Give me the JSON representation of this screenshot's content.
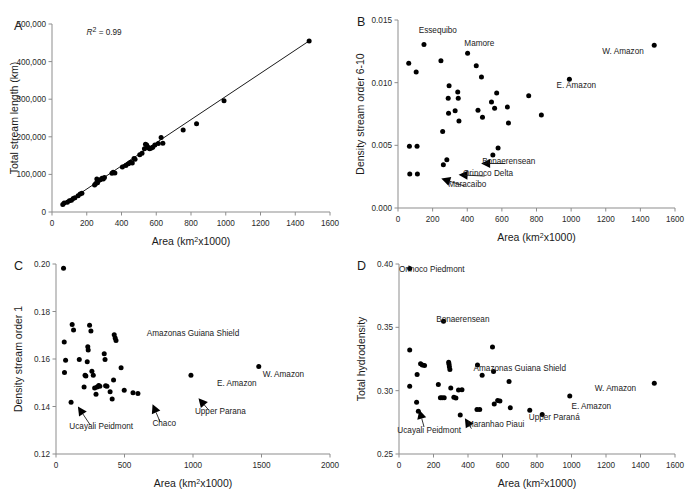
{
  "figure": {
    "panels": [
      "A",
      "B",
      "C",
      "D"
    ]
  },
  "chart_data": [
    {
      "panel": "A",
      "type": "scatter",
      "title": "",
      "xlabel": "Area (km2x1000)",
      "ylabel": "Total stream length (km)",
      "xlim": [
        0,
        1600
      ],
      "ylim": [
        0,
        500000
      ],
      "xticks": [
        0,
        200,
        400,
        600,
        800,
        1000,
        1200,
        1400,
        1600
      ],
      "xticklabels": [
        "0",
        "200",
        "400",
        "600",
        "800",
        "1000",
        "1200",
        "1400",
        "1600"
      ],
      "yticks": [
        0,
        100000,
        200000,
        300000,
        400000,
        500000
      ],
      "yticklabels": [
        "0",
        "100,000",
        "200,000",
        "300,000",
        "400,000",
        "500,000"
      ],
      "grid": false,
      "legend": "none",
      "annotations": [
        {
          "text": "R2 = 0.99",
          "x": 300,
          "y": 470000
        }
      ],
      "trendline": {
        "x": [
          60,
          1480
        ],
        "y": [
          18000,
          455000
        ]
      },
      "points": [
        {
          "x": 62,
          "y": 20000
        },
        {
          "x": 70,
          "y": 24000
        },
        {
          "x": 88,
          "y": 26000
        },
        {
          "x": 100,
          "y": 30000
        },
        {
          "x": 112,
          "y": 31000
        },
        {
          "x": 122,
          "y": 36000
        },
        {
          "x": 132,
          "y": 38000
        },
        {
          "x": 150,
          "y": 43000
        },
        {
          "x": 162,
          "y": 48000
        },
        {
          "x": 172,
          "y": 50000
        },
        {
          "x": 245,
          "y": 72000
        },
        {
          "x": 252,
          "y": 76000
        },
        {
          "x": 258,
          "y": 88000
        },
        {
          "x": 262,
          "y": 78000
        },
        {
          "x": 268,
          "y": 84000
        },
        {
          "x": 278,
          "y": 86000
        },
        {
          "x": 288,
          "y": 90000
        },
        {
          "x": 295,
          "y": 88000
        },
        {
          "x": 302,
          "y": 92000
        },
        {
          "x": 345,
          "y": 103000
        },
        {
          "x": 352,
          "y": 106000
        },
        {
          "x": 362,
          "y": 104000
        },
        {
          "x": 405,
          "y": 120000
        },
        {
          "x": 425,
          "y": 124000
        },
        {
          "x": 440,
          "y": 128000
        },
        {
          "x": 452,
          "y": 132000
        },
        {
          "x": 462,
          "y": 130000
        },
        {
          "x": 472,
          "y": 142000
        },
        {
          "x": 478,
          "y": 140000
        },
        {
          "x": 505,
          "y": 152000
        },
        {
          "x": 518,
          "y": 156000
        },
        {
          "x": 532,
          "y": 168000
        },
        {
          "x": 538,
          "y": 180000
        },
        {
          "x": 545,
          "y": 178000
        },
        {
          "x": 552,
          "y": 172000
        },
        {
          "x": 558,
          "y": 170000
        },
        {
          "x": 562,
          "y": 168000
        },
        {
          "x": 572,
          "y": 170000
        },
        {
          "x": 580,
          "y": 172000
        },
        {
          "x": 592,
          "y": 178000
        },
        {
          "x": 612,
          "y": 182000
        },
        {
          "x": 628,
          "y": 198000
        },
        {
          "x": 638,
          "y": 183000
        },
        {
          "x": 755,
          "y": 218000
        },
        {
          "x": 832,
          "y": 235000
        },
        {
          "x": 990,
          "y": 296000
        },
        {
          "x": 1480,
          "y": 455000
        }
      ]
    },
    {
      "panel": "B",
      "type": "scatter",
      "title": "",
      "xlabel": "Area (km2x1000)",
      "ylabel": "Density stream order 6-10",
      "xlim": [
        0,
        1600
      ],
      "ylim": [
        0.0,
        0.015
      ],
      "xticks": [
        0,
        200,
        400,
        600,
        800,
        1000,
        1200,
        1400,
        1600
      ],
      "xticklabels": [
        "0",
        "200",
        "400",
        "600",
        "800",
        "1000",
        "1200",
        "1400",
        "1600"
      ],
      "yticks": [
        0.0,
        0.005,
        0.01,
        0.015
      ],
      "yticklabels": [
        "0.000",
        "0.005",
        "0.010",
        "0.015"
      ],
      "grid": false,
      "legend": "none",
      "labels": [
        {
          "text": "Essequibo",
          "x": 230,
          "y": 0.014
        },
        {
          "text": "Mamore",
          "x": 470,
          "y": 0.01295
        },
        {
          "text": "W. Amazon",
          "x": 1300,
          "y": 0.01225
        },
        {
          "text": "E. Amazon",
          "x": 1030,
          "y": 0.00955
        },
        {
          "text": "Bonaerensean",
          "x": 640,
          "y": 0.00355
        },
        {
          "text": "Orinoco Delta",
          "x": 520,
          "y": 0.00255
        },
        {
          "text": "Maracaibo",
          "x": 400,
          "y": 0.00165
        }
      ],
      "arrows": [
        {
          "label": "Bonaerensean",
          "from_x": 620,
          "from_y": 0.00355,
          "to_x": 480,
          "to_y": 0.00355
        },
        {
          "label": "Orinoco Delta",
          "from_x": 500,
          "from_y": 0.00255,
          "to_x": 350,
          "to_y": 0.00265
        },
        {
          "label": "Maracaibo",
          "from_x": 385,
          "from_y": 0.00175,
          "to_x": 250,
          "to_y": 0.00235
        }
      ],
      "points": [
        {
          "x": 62,
          "y": 0.01155
        },
        {
          "x": 105,
          "y": 0.01085
        },
        {
          "x": 150,
          "y": 0.01305
        },
        {
          "x": 248,
          "y": 0.01175
        },
        {
          "x": 258,
          "y": 0.0061
        },
        {
          "x": 295,
          "y": 0.00975
        },
        {
          "x": 290,
          "y": 0.00875
        },
        {
          "x": 292,
          "y": 0.00755
        },
        {
          "x": 330,
          "y": 0.00775
        },
        {
          "x": 345,
          "y": 0.00925
        },
        {
          "x": 348,
          "y": 0.00875
        },
        {
          "x": 352,
          "y": 0.00695
        },
        {
          "x": 402,
          "y": 0.01235
        },
        {
          "x": 452,
          "y": 0.01135
        },
        {
          "x": 462,
          "y": 0.0078
        },
        {
          "x": 482,
          "y": 0.01045
        },
        {
          "x": 488,
          "y": 0.00725
        },
        {
          "x": 540,
          "y": 0.00845
        },
        {
          "x": 548,
          "y": 0.00422
        },
        {
          "x": 558,
          "y": 0.00795
        },
        {
          "x": 570,
          "y": 0.00918
        },
        {
          "x": 578,
          "y": 0.00478
        },
        {
          "x": 632,
          "y": 0.00805
        },
        {
          "x": 638,
          "y": 0.00678
        },
        {
          "x": 755,
          "y": 0.00895
        },
        {
          "x": 828,
          "y": 0.00742
        },
        {
          "x": 990,
          "y": 0.01028
        },
        {
          "x": 1480,
          "y": 0.01298
        },
        {
          "x": 66,
          "y": 0.00492
        },
        {
          "x": 110,
          "y": 0.00492
        },
        {
          "x": 68,
          "y": 0.00272
        },
        {
          "x": 112,
          "y": 0.00272
        },
        {
          "x": 262,
          "y": 0.00345
        },
        {
          "x": 282,
          "y": 0.00385
        }
      ]
    },
    {
      "panel": "C",
      "type": "scatter",
      "title": "",
      "xlabel": "Area (km2x1000)",
      "ylabel": "Density stream order 1",
      "xlim": [
        0,
        2000
      ],
      "ylim": [
        0.12,
        0.2
      ],
      "xticks": [
        0,
        500,
        1000,
        1500,
        2000
      ],
      "xticklabels": [
        "0",
        "500",
        "1000",
        "1500",
        "2000"
      ],
      "yticks": [
        0.12,
        0.14,
        0.16,
        0.18,
        0.2
      ],
      "yticklabels": [
        "0.12",
        "0.14",
        "0.16",
        "0.18",
        "0.20"
      ],
      "grid": false,
      "legend": "none",
      "labels": [
        {
          "text": "Amazonas Guiana Shield",
          "x": 1000,
          "y": 0.1695
        },
        {
          "text": "W. Amazon",
          "x": 1660,
          "y": 0.1525
        },
        {
          "text": "E. Amazon",
          "x": 1320,
          "y": 0.1487
        },
        {
          "text": "Ucayali Peidmont",
          "x": 330,
          "y": 0.1305
        },
        {
          "text": "Chaco",
          "x": 790,
          "y": 0.1318
        },
        {
          "text": "Upper Parana",
          "x": 1200,
          "y": 0.1368
        }
      ],
      "arrows": [
        {
          "label": "Ucayali Peidmont",
          "from_x": 250,
          "from_y": 0.1322,
          "to_x": 160,
          "to_y": 0.14
        },
        {
          "label": "Chaco",
          "from_x": 760,
          "from_y": 0.1335,
          "to_x": 705,
          "to_y": 0.141
        },
        {
          "label": "Upper Parana",
          "from_x": 1115,
          "from_y": 0.1385,
          "to_x": 1040,
          "to_y": 0.1435
        }
      ],
      "points": [
        {
          "x": 55,
          "y": 0.1982
        },
        {
          "x": 60,
          "y": 0.1672
        },
        {
          "x": 70,
          "y": 0.1595
        },
        {
          "x": 62,
          "y": 0.1543
        },
        {
          "x": 118,
          "y": 0.1745
        },
        {
          "x": 128,
          "y": 0.1722
        },
        {
          "x": 110,
          "y": 0.1418
        },
        {
          "x": 170,
          "y": 0.1598
        },
        {
          "x": 228,
          "y": 0.1588
        },
        {
          "x": 245,
          "y": 0.1742
        },
        {
          "x": 255,
          "y": 0.1718
        },
        {
          "x": 232,
          "y": 0.1652
        },
        {
          "x": 235,
          "y": 0.1638
        },
        {
          "x": 212,
          "y": 0.1532
        },
        {
          "x": 218,
          "y": 0.1528
        },
        {
          "x": 205,
          "y": 0.1482
        },
        {
          "x": 262,
          "y": 0.1548
        },
        {
          "x": 272,
          "y": 0.1532
        },
        {
          "x": 282,
          "y": 0.1478
        },
        {
          "x": 292,
          "y": 0.1452
        },
        {
          "x": 300,
          "y": 0.1482
        },
        {
          "x": 312,
          "y": 0.1488
        },
        {
          "x": 320,
          "y": 0.1485
        },
        {
          "x": 352,
          "y": 0.1622
        },
        {
          "x": 358,
          "y": 0.1598
        },
        {
          "x": 362,
          "y": 0.1487
        },
        {
          "x": 372,
          "y": 0.1485
        },
        {
          "x": 395,
          "y": 0.1462
        },
        {
          "x": 420,
          "y": 0.1512
        },
        {
          "x": 425,
          "y": 0.1702
        },
        {
          "x": 432,
          "y": 0.1688
        },
        {
          "x": 438,
          "y": 0.1678
        },
        {
          "x": 410,
          "y": 0.1432
        },
        {
          "x": 475,
          "y": 0.1563
        },
        {
          "x": 498,
          "y": 0.1468
        },
        {
          "x": 562,
          "y": 0.1458
        },
        {
          "x": 598,
          "y": 0.1455
        },
        {
          "x": 985,
          "y": 0.1532
        },
        {
          "x": 1480,
          "y": 0.1568
        }
      ]
    },
    {
      "panel": "D",
      "type": "scatter",
      "title": "",
      "xlabel": "Area (km2x1000)",
      "ylabel": "Total hydrodensity",
      "xlim": [
        0,
        1600
      ],
      "ylim": [
        0.25,
        0.4
      ],
      "xticks": [
        0,
        200,
        400,
        600,
        800,
        1000,
        1200,
        1400,
        1600
      ],
      "xticklabels": [
        "0",
        "200",
        "400",
        "600",
        "800",
        "1000",
        "1200",
        "1400",
        "1600"
      ],
      "yticks": [
        0.25,
        0.3,
        0.35,
        0.4
      ],
      "yticklabels": [
        "0.25",
        "0.30",
        "0.35",
        "0.40"
      ],
      "grid": false,
      "legend": "none",
      "labels": [
        {
          "text": "Orinoco Piedmont",
          "x": 190,
          "y": 0.3935
        },
        {
          "text": "Bonaerensean",
          "x": 370,
          "y": 0.3545
        },
        {
          "text": "Amazonas Guiana Shield",
          "x": 700,
          "y": 0.3152
        },
        {
          "text": "W. Amazon",
          "x": 1255,
          "y": 0.2995
        },
        {
          "text": "E. Amazon",
          "x": 1115,
          "y": 0.2855
        },
        {
          "text": "Ucayali Peidmont",
          "x": 175,
          "y": 0.2665
        },
        {
          "text": "Maranhao Piaui",
          "x": 560,
          "y": 0.2715
        },
        {
          "text": "Upper Paraná",
          "x": 900,
          "y": 0.2768
        }
      ],
      "arrows": [
        {
          "label": "Ucayali Peidmont",
          "from_x": 145,
          "from_y": 0.2715,
          "to_x": 118,
          "to_y": 0.2848
        },
        {
          "label": "Maranhao Piaui",
          "from_x": 420,
          "from_y": 0.27,
          "to_x": 382,
          "to_y": 0.2782
        }
      ],
      "points": [
        {
          "x": 62,
          "y": 0.3965
        },
        {
          "x": 258,
          "y": 0.3548
        },
        {
          "x": 62,
          "y": 0.3322
        },
        {
          "x": 62,
          "y": 0.3035
        },
        {
          "x": 105,
          "y": 0.3128
        },
        {
          "x": 125,
          "y": 0.3212
        },
        {
          "x": 135,
          "y": 0.3202
        },
        {
          "x": 148,
          "y": 0.3198
        },
        {
          "x": 102,
          "y": 0.2908
        },
        {
          "x": 112,
          "y": 0.2838
        },
        {
          "x": 228,
          "y": 0.3048
        },
        {
          "x": 240,
          "y": 0.2945
        },
        {
          "x": 250,
          "y": 0.2945
        },
        {
          "x": 262,
          "y": 0.2945
        },
        {
          "x": 288,
          "y": 0.3225
        },
        {
          "x": 290,
          "y": 0.3208
        },
        {
          "x": 292,
          "y": 0.3188
        },
        {
          "x": 295,
          "y": 0.3168
        },
        {
          "x": 300,
          "y": 0.3022
        },
        {
          "x": 318,
          "y": 0.2948
        },
        {
          "x": 330,
          "y": 0.2942
        },
        {
          "x": 345,
          "y": 0.3005
        },
        {
          "x": 355,
          "y": 0.2808
        },
        {
          "x": 365,
          "y": 0.3008
        },
        {
          "x": 455,
          "y": 0.3202
        },
        {
          "x": 452,
          "y": 0.2852
        },
        {
          "x": 468,
          "y": 0.2852
        },
        {
          "x": 482,
          "y": 0.3122
        },
        {
          "x": 542,
          "y": 0.3345
        },
        {
          "x": 548,
          "y": 0.3152
        },
        {
          "x": 552,
          "y": 0.2895
        },
        {
          "x": 572,
          "y": 0.2922
        },
        {
          "x": 585,
          "y": 0.2918
        },
        {
          "x": 638,
          "y": 0.3072
        },
        {
          "x": 645,
          "y": 0.2865
        },
        {
          "x": 758,
          "y": 0.2845
        },
        {
          "x": 830,
          "y": 0.2812
        },
        {
          "x": 990,
          "y": 0.2958
        },
        {
          "x": 1480,
          "y": 0.3058
        }
      ]
    }
  ]
}
